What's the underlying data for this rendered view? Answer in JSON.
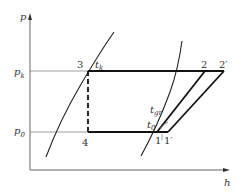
{
  "diagram": {
    "type": "p-h refrigeration cycle diagram",
    "axes": {
      "y_label": "p",
      "x_label": "h"
    },
    "pressure_levels": {
      "high": {
        "symbol": "p",
        "subscript": "k"
      },
      "low": {
        "symbol": "p",
        "subscript": "0"
      }
    },
    "points": {
      "p3": "3",
      "p4": "4",
      "p1": "1",
      "p1prime": "1′",
      "p2": "2",
      "p2prime": "2′"
    },
    "temperatures": {
      "tk": {
        "symbol": "t",
        "subscript": "k"
      },
      "tgr": {
        "symbol": "t",
        "subscript": "gr"
      },
      "t0": {
        "symbol": "t",
        "subscript": "0"
      }
    },
    "colors": {
      "line": "#1a1a1a",
      "thin_line": "#555555",
      "text": "#333333",
      "background": "#ffffff"
    }
  }
}
